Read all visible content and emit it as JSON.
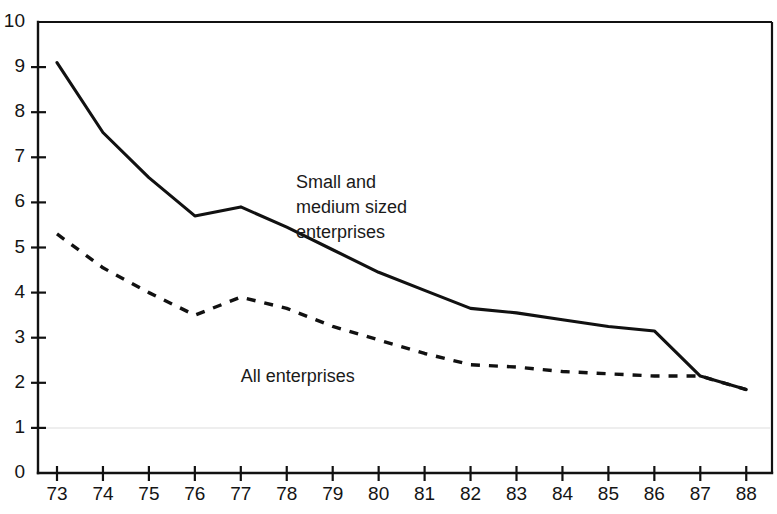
{
  "chart_data": {
    "type": "line",
    "title": "",
    "subtitle": "",
    "xlabel": "",
    "ylabel": "",
    "xlim": [
      73,
      88
    ],
    "ylim": [
      0,
      10
    ],
    "grid": false,
    "legend_position": "inline-annotation",
    "x": [
      73,
      74,
      75,
      76,
      77,
      78,
      79,
      80,
      81,
      82,
      83,
      84,
      85,
      86,
      87,
      88
    ],
    "categories": [
      "73",
      "74",
      "75",
      "76",
      "77",
      "78",
      "79",
      "80",
      "81",
      "82",
      "83",
      "84",
      "85",
      "86",
      "87",
      "88"
    ],
    "xticks": [
      "73",
      "74",
      "75",
      "76",
      "77",
      "78",
      "79",
      "80",
      "81",
      "82",
      "83",
      "84",
      "85",
      "86",
      "87",
      "88"
    ],
    "yticks": [
      "0",
      "1",
      "2",
      "3",
      "4",
      "5",
      "6",
      "7",
      "8",
      "9",
      "10"
    ],
    "series": [
      {
        "name": "Small and medium sized enterprises",
        "style": "solid",
        "color": "#111111",
        "values": [
          9.1,
          7.55,
          6.55,
          5.7,
          5.9,
          5.45,
          4.95,
          4.45,
          4.05,
          3.65,
          3.55,
          3.4,
          3.25,
          3.15,
          2.15,
          1.85
        ]
      },
      {
        "name": "All enterprises",
        "style": "dashed",
        "color": "#111111",
        "values": [
          5.3,
          4.55,
          4.0,
          3.5,
          3.9,
          3.65,
          3.25,
          2.95,
          2.65,
          2.4,
          2.35,
          2.25,
          2.2,
          2.15,
          2.15,
          1.85
        ]
      }
    ],
    "annotations": [
      {
        "id": "smes-label",
        "text_lines": [
          "Small and",
          "medium sized",
          "enterprises"
        ],
        "x": 78.2,
        "y": 6.6
      },
      {
        "id": "all-label",
        "text_lines": [
          "All enterprises"
        ],
        "x": 77.0,
        "y": 2.3
      }
    ]
  }
}
